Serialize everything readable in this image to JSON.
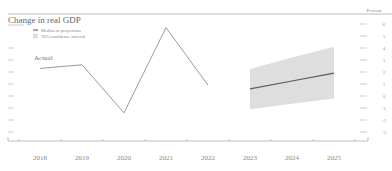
{
  "chart_data": {
    "type": "line",
    "title": "Change in real GDP",
    "unit_label": "Percent",
    "xlabel": "",
    "ylabel": "Percent",
    "x": [
      "2018",
      "2019",
      "2020",
      "2021",
      "2022",
      "2023",
      "2024",
      "2025"
    ],
    "ylim": [
      -3.5,
      6.5
    ],
    "y_ticks": [
      6,
      5,
      4,
      3,
      2,
      1,
      0,
      -1,
      -2,
      -3
    ],
    "grid": false,
    "legend_position": "upper-left",
    "legend": [
      {
        "label": "Median of projections",
        "marker": "line",
        "color": "#555555"
      },
      {
        "label": "70% confidence interval",
        "marker": "square",
        "color": "#dddddd"
      }
    ],
    "annotations": [
      {
        "text": "Actual",
        "x": "2018",
        "y": 3.0
      }
    ],
    "series": [
      {
        "name": "Actual",
        "x": [
          "2018",
          "2019",
          "2020",
          "2021",
          "2022"
        ],
        "values": [
          2.3,
          2.6,
          -1.4,
          5.7,
          0.9
        ],
        "color": "#999999"
      },
      {
        "name": "Median of projections",
        "x": [
          "2023",
          "2024",
          "2025"
        ],
        "values": [
          0.6,
          1.25,
          1.9
        ],
        "color": "#555555"
      },
      {
        "name": "70% confidence interval (upper)",
        "x": [
          "2023",
          "2024",
          "2025"
        ],
        "values": [
          2.25,
          3.2,
          4.1
        ]
      },
      {
        "name": "70% confidence interval (lower)",
        "x": [
          "2023",
          "2024",
          "2025"
        ],
        "values": [
          -1.1,
          -0.65,
          -0.2
        ]
      }
    ]
  },
  "colors": {
    "actual_line": "#9a9a9a",
    "median_line": "#5a5a5a",
    "band_fill": "#dedede",
    "axis": "#aaaaaa",
    "text": "#777777"
  }
}
